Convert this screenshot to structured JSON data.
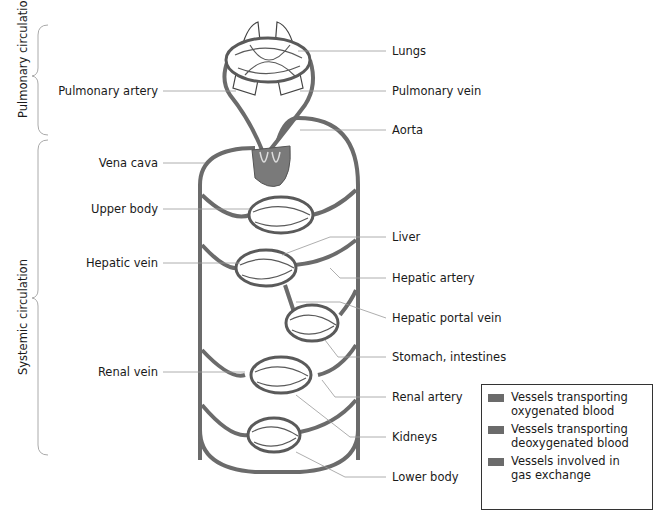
{
  "side_labels": {
    "pulmonary": "Pulmonary circulation",
    "systemic": "Systemic circulation"
  },
  "left_labels": {
    "pulmonary_artery": "Pulmonary artery",
    "vena_cava": "Vena cava",
    "upper_body": "Upper body",
    "hepatic_vein": "Hepatic vein",
    "renal_vein": "Renal vein"
  },
  "right_labels": {
    "lungs": "Lungs",
    "pulmonary_vein": "Pulmonary vein",
    "aorta": "Aorta",
    "liver": "Liver",
    "hepatic_artery": "Hepatic artery",
    "hepatic_portal_vein": "Hepatic portal vein",
    "stomach_intestines": "Stomach, intestines",
    "renal_artery": "Renal artery",
    "kidneys": "Kidneys",
    "lower_body": "Lower body"
  },
  "legend": {
    "items": [
      {
        "text1": "Vessels transporting",
        "text2": "oxygenated blood"
      },
      {
        "text1": "Vessels transporting",
        "text2": "deoxygenated blood"
      },
      {
        "text1": "Vessels involved in",
        "text2": "gas exchange"
      }
    ]
  },
  "colors": {
    "vessel": "#6b6b6b",
    "heart": "#7a7a7a",
    "leader": "#999999"
  }
}
